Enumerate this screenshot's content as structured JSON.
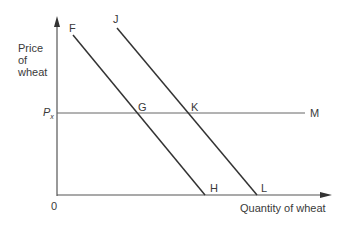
{
  "diagram": {
    "y_axis_label": [
      "Price",
      "of",
      "wheat"
    ],
    "x_axis_label": "Quantity of wheat",
    "origin_label": "0",
    "price_level_label": "P",
    "price_level_subscript": "x",
    "points": {
      "F": "F",
      "G": "G",
      "H": "H",
      "J": "J",
      "K": "K",
      "L": "L",
      "M": "M"
    },
    "lines": [
      {
        "name": "FH",
        "from": "F",
        "to": "H",
        "through": "G"
      },
      {
        "name": "JL",
        "from": "J",
        "to": "L",
        "through": "K"
      },
      {
        "name": "PxM",
        "from": "Px",
        "to": "M",
        "through": [
          "G",
          "K"
        ]
      }
    ],
    "line_color": "#3a3a3a"
  }
}
